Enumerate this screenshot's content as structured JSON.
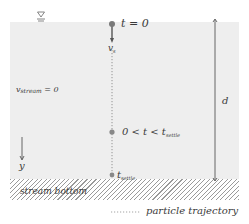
{
  "diagram": {
    "title": "",
    "water_surface_symbol": "water-surface-symbol",
    "labels": {
      "t_start": "t = 0",
      "settling_velocity_main": "v",
      "settling_velocity_sub": "s",
      "stream_velocity_main": "v",
      "stream_velocity_sub": "stream",
      "stream_velocity_value": " = 0",
      "mid_time_main": "0 < t < t",
      "mid_time_sub": "settle",
      "settle_time_main": "t",
      "settle_time_sub": "settle",
      "depth": "d",
      "depth_axis": "y",
      "stream_bottom": "stream bottom"
    },
    "legend": {
      "particle_trajectory": "particle trajectory"
    },
    "colors": {
      "water": "#eeeeee",
      "particle": "#7a7a7a",
      "line": "#555555",
      "hatch": "#9a9a9a"
    }
  }
}
